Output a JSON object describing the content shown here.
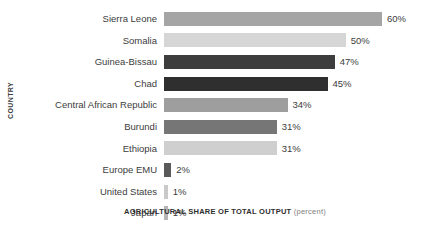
{
  "chart_data": {
    "type": "bar",
    "orientation": "horizontal",
    "title": "",
    "xlabel": "AGRICULTURAL SHARE OF TOTAL OUTPUT",
    "xlabel_suffix": "(percent)",
    "ylabel": "COUNTRY",
    "xlim": [
      0,
      60
    ],
    "grid": false,
    "legend": "none",
    "value_suffix": "%",
    "categories": [
      "Sierra Leone",
      "Somalia",
      "Guinea-Bissau",
      "Chad",
      "Central African Republic",
      "Burundi",
      "Ethiopia",
      "Europe EMU",
      "United States",
      "Japan"
    ],
    "values": [
      60,
      50,
      47,
      45,
      34,
      31,
      31,
      2,
      1,
      1
    ],
    "value_labels": [
      "60%",
      "50%",
      "47%",
      "45%",
      "34%",
      "31%",
      "31%",
      "2%",
      "1%",
      "1%"
    ],
    "bar_colors": [
      "#a5a5a5",
      "#d6d6d6",
      "#3d3d3d",
      "#2f2f2f",
      "#9e9e9e",
      "#767676",
      "#cfcfcf",
      "#5a5a5a",
      "#c9c9c9",
      "#b5b5b5"
    ]
  },
  "colors": {
    "background": "#ffffff",
    "text": "#3c3c3c",
    "axis_title": "#2e2e2e",
    "axis_title_soft": "#7d7d7d"
  }
}
